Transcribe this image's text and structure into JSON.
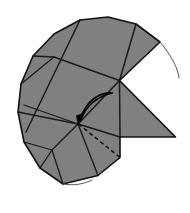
{
  "figure": {
    "canvas": {
      "width": 190,
      "height": 213
    },
    "background_color": "#ffffff",
    "palette": {
      "paper_fill": "#808080",
      "crease_line": "#1a1a1a",
      "outline": "#111111",
      "thin_arc": "#555555",
      "dashed_fold": "#0d0d0d",
      "motion_arrow": "#000000"
    },
    "stroke_widths": {
      "outline": 1.6,
      "crease": 1.5,
      "thin_arc": 1.0,
      "dashed_fold": 1.5,
      "motion_arrow": 1.6
    },
    "dash_pattern": "4,3"
  },
  "shapes": {
    "paper_body": {
      "name": "folded-paper-silhouette",
      "path": "M 119.5 80.5 L 175.5 137.0 L 120.0 137.0 L 120.0 157.5 L 98.0 175.5 L 63.0 184.0 L 40.0 168.0 L 24.0 142.0 L 18.0 112.0 L 21.0 84.0 L 33.0 56.0 L 54.0 34.0 L 80.0 20.0 L 108.0 17.0 L 136.0 24.0 L 160.0 42.0 L 119.5 80.5 Z"
    },
    "outer_outline": {
      "name": "paper-outline",
      "path": "M 119.5 80.5 L 175.5 137.0 L 120.0 137.0 L 120.0 157.5 L 98.0 175.5 L 63.0 184.0 L 40.0 168.0 L 24.0 142.0 L 18.0 112.0 L 21.0 84.0 L 33.0 56.0 L 54.0 34.0 L 80.0 20.0 L 108.0 17.0 L 136.0 24.0 L 160.0 42.0 L 119.5 80.5 Z"
    },
    "crease_lines": [
      {
        "name": "crease-upper-diagonal-right",
        "path": "M 136.0 24.0 L 119.5 80.5"
      },
      {
        "name": "crease-top-horizontal",
        "path": "M 54.0 57.0 L 119.5 80.5"
      },
      {
        "name": "crease-left-upper-edge",
        "path": "M 33.0 56.0 L 54.0 57.0"
      },
      {
        "name": "crease-left-slant-a",
        "path": "M 54.0 57.0 L 21.0 84.0"
      },
      {
        "name": "crease-diagonal-long",
        "path": "M 80.0 20.0 L 26.0 132.0"
      },
      {
        "name": "crease-mid-horizontal",
        "path": "M 24.0 105.0 L 78.0 124.0"
      },
      {
        "name": "crease-left-to-hub",
        "path": "M 18.0 112.0 L 78.0 124.0"
      },
      {
        "name": "crease-hub-to-apex",
        "path": "M 78.0 124.0 L 119.5 80.5"
      },
      {
        "name": "crease-hub-to-right-corner",
        "path": "M 78.0 124.0 L 120.0 137.0"
      },
      {
        "name": "crease-hub-to-lower-right",
        "path": "M 78.0 124.0 L 98.0 175.5"
      },
      {
        "name": "crease-hub-to-lower-left",
        "path": "M 78.0 124.0 L 52.0 150.0"
      },
      {
        "name": "crease-lower-left-branch",
        "path": "M 52.0 150.0 L 40.0 168.0"
      },
      {
        "name": "crease-lower-left-to-edge",
        "path": "M 52.0 150.0 L 24.0 142.0"
      },
      {
        "name": "crease-lower-run",
        "path": "M 52.0 150.0 L 63.0 184.0"
      },
      {
        "name": "crease-right-flap-edge",
        "path": "M 119.5 80.5 L 120.0 137.0"
      }
    ],
    "thin_arcs": [
      {
        "name": "construction-arc-upper-right",
        "path": "M 160.0 42.0 C 172.0 56.0 178.5 70.0 179.0 78.0"
      },
      {
        "name": "construction-arc-lower",
        "path": "M 63.0 184.0 C 74.0 186.0 84.0 184.0 92.0 180.0"
      }
    ],
    "dashed_fold": {
      "name": "hidden-fold-line",
      "path": "M 78.5 124.0 L 120.0 157.5"
    },
    "motion_arrows": [
      {
        "name": "fold-motion-arc-outer",
        "path": "M 112.0 93.0 C 100.0 92.0 86.0 100.0 79.5 121.0"
      },
      {
        "name": "fold-motion-arc-inner",
        "path": "M 112.0 93.0 C 96.0 97.0 85.5 106.0 80.5 121.0"
      }
    ],
    "arrow_head": {
      "name": "fold-direction-arrowhead",
      "path": "M 78.0 125.5 L 83.5 113.0 L 76.0 115.5 Z"
    }
  },
  "labels": {
    "caption": "",
    "annotations": []
  }
}
